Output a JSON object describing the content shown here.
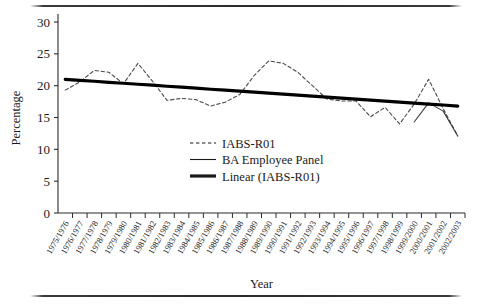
{
  "figure": {
    "has_top_rule": true,
    "has_bottom_rule": true
  },
  "chart_data": {
    "type": "line",
    "title": "",
    "xlabel": "Year",
    "ylabel": "Percentage",
    "ylim": [
      0,
      30
    ],
    "yticks": [
      0,
      5,
      10,
      15,
      20,
      25,
      30
    ],
    "grid": false,
    "legend_position": "center",
    "categories": [
      "1975/1976",
      "1976/1977",
      "1977/1978",
      "1978/1979",
      "1979/1980",
      "1980/1981",
      "1981/1982",
      "1982/1983",
      "1983/1984",
      "1984/1985",
      "1985/1986",
      "1986/1987",
      "1987/1988",
      "1988/1989",
      "1989/1990",
      "1990/1991",
      "1991/1992",
      "1992/1993",
      "1993/1994",
      "1994/1995",
      "1995/1996",
      "1996/1997",
      "1997/1998",
      "1998/1999",
      "1999/2000",
      "2000/2001",
      "2001/2002",
      "2002/2003"
    ],
    "series": [
      {
        "name": "IABS-R01",
        "style": "dashed",
        "color": "#4a4a4a",
        "values": [
          19.3,
          20.6,
          22.4,
          22.1,
          20.3,
          23.5,
          20.7,
          17.7,
          18.0,
          17.8,
          16.8,
          17.4,
          18.6,
          21.6,
          23.9,
          23.5,
          22.1,
          20.0,
          17.9,
          17.6,
          17.6,
          15.1,
          16.6,
          14.0,
          17.1,
          21.0,
          16.4,
          12.1
        ]
      },
      {
        "name": "BA Employee Panel",
        "style": "solid-thin",
        "color": "#3a3a3a",
        "values": [
          null,
          null,
          null,
          null,
          null,
          null,
          null,
          null,
          null,
          null,
          null,
          null,
          null,
          null,
          null,
          null,
          null,
          null,
          null,
          null,
          null,
          null,
          null,
          null,
          14.3,
          17.3,
          16.0,
          12.1
        ]
      },
      {
        "name": "Linear (IABS-R01)",
        "style": "solid-thick",
        "color": "#000000",
        "values": [
          21.0,
          20.84,
          20.69,
          20.53,
          20.38,
          20.22,
          20.07,
          19.91,
          19.76,
          19.6,
          19.44,
          19.29,
          19.13,
          18.98,
          18.82,
          18.67,
          18.51,
          18.36,
          18.2,
          18.04,
          17.89,
          17.73,
          17.58,
          17.42,
          17.27,
          17.11,
          16.96,
          16.8
        ]
      }
    ],
    "legend": [
      {
        "label": "IABS-R01",
        "marker": "dashed"
      },
      {
        "label": "BA Employee Panel",
        "marker": "solid-thin"
      },
      {
        "label": "Linear (IABS-R01)",
        "marker": "solid-thick"
      }
    ]
  }
}
